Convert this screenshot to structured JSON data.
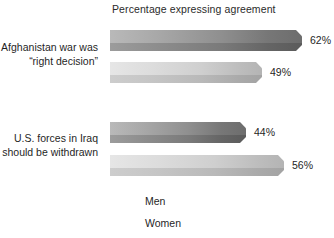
{
  "chart_data": {
    "type": "bar",
    "orientation": "horizontal",
    "title": "Percentage expressing agreement",
    "xlabel": "",
    "ylabel": "",
    "xlim": [
      0,
      70
    ],
    "grid": false,
    "legend_position": "bottom-left",
    "categories": [
      "Afghanistan war was “right decision”",
      "U.S. forces in Iraq should be withdrawn"
    ],
    "series": [
      {
        "name": "Men",
        "values": [
          62,
          44
        ],
        "color": "#7a7a7a"
      },
      {
        "name": "Women",
        "values": [
          49,
          56
        ],
        "color": "#cfcfcf"
      }
    ],
    "data_labels": [
      "62%",
      "49%",
      "44%",
      "56%"
    ]
  },
  "title": {
    "text": "Percentage expressing agreement"
  },
  "categories": [
    {
      "line1": "Afghanistan war was",
      "line2": "“right decision”"
    },
    {
      "line1": "U.S. forces in Iraq",
      "line2": "should be withdrawn"
    }
  ],
  "bars": [
    {
      "series": "Men",
      "category": "Afghanistan war was “right decision”",
      "value": 62,
      "label": "62%"
    },
    {
      "series": "Women",
      "category": "Afghanistan war was “right decision”",
      "value": 49,
      "label": "49%"
    },
    {
      "series": "Men",
      "category": "U.S. forces in Iraq should be withdrawn",
      "value": 44,
      "label": "44%"
    },
    {
      "series": "Women",
      "category": "U.S. forces in Iraq should be withdrawn",
      "value": 56,
      "label": "56%"
    }
  ],
  "legend": [
    {
      "label": "Men",
      "color": "#7a7a7a"
    },
    {
      "label": "Women",
      "color": "#cfcfcf"
    }
  ]
}
